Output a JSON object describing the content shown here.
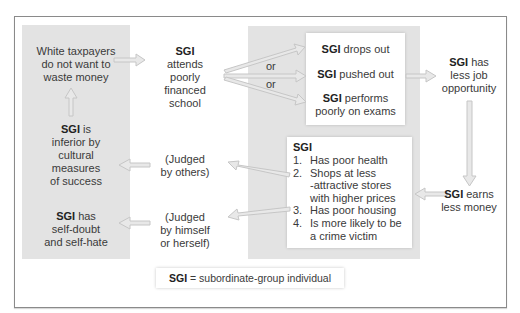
{
  "diagram": {
    "type": "flow",
    "nodes": {
      "taxpayers": {
        "text": "White taxpayers do not want to waste money",
        "lines": [
          "White taxpayers",
          "do not want to",
          "waste money"
        ]
      },
      "school": {
        "bold": "SGI",
        "lines": [
          "attends",
          "poorly",
          "financed",
          "school"
        ]
      },
      "drops_out": {
        "bold": "SGI",
        "rest": " drops out"
      },
      "pushed_out": {
        "bold": "SGI",
        "rest": " pushed out"
      },
      "performs": {
        "bold": "SGI",
        "rest": " performs",
        "line2": "poorly on exams"
      },
      "or_1": "or",
      "or_2": "or",
      "job": {
        "bold": "SGI",
        "rest": " has",
        "lines": [
          "less job",
          "opportunity"
        ]
      },
      "earns": {
        "bold": "SGI",
        "rest": " earns",
        "line2": "less money"
      },
      "consequences": {
        "title": "SGI",
        "items": [
          {
            "num": "1.",
            "lines": [
              "Has poor health"
            ]
          },
          {
            "num": "2.",
            "lines": [
              "Shops at less",
              "-attractive stores",
              "with higher prices"
            ]
          },
          {
            "num": "3.",
            "lines": [
              "Has poor housing"
            ]
          },
          {
            "num": "4.",
            "lines": [
              "Is more likely to be",
              "a crime victim"
            ]
          }
        ]
      },
      "judged_others": {
        "lines": [
          "(Judged",
          "by others)"
        ]
      },
      "judged_self": {
        "lines": [
          "(Judged",
          "by himself",
          "or herself)"
        ]
      },
      "inferior": {
        "bold": "SGI",
        "rest": " is",
        "lines": [
          "inferior by",
          "cultural",
          "measures",
          "of success"
        ]
      },
      "self_doubt": {
        "bold": "SGI",
        "rest": " has",
        "lines": [
          "self-doubt",
          "and self-hate"
        ]
      }
    },
    "legend": {
      "bold": "SGI",
      "rest": " = subordinate-group individual"
    },
    "colors": {
      "panel": "#e3e3e3",
      "arrow_fill": "#e6e6e6",
      "arrow_stroke": "#c4c4c4",
      "frame": "#8a8a8a"
    }
  }
}
